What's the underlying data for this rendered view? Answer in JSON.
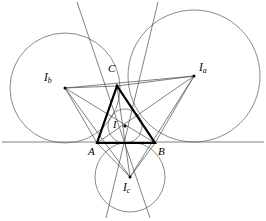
{
  "figure": {
    "domain": "diagram",
    "canvas": {
      "width": 266,
      "height": 221,
      "background": "#ffffff"
    },
    "colors": {
      "thin_line": "#4a4a4a",
      "circle_line": "#5a5a5a",
      "bold_line": "#000000",
      "point": "#000000",
      "label": "#000000"
    },
    "stroke_widths": {
      "thin": 0.7,
      "circle": 0.7,
      "bold": 2.1
    },
    "labels": {
      "A": {
        "text": "A",
        "sub": "",
        "x": 88,
        "y": 146
      },
      "B": {
        "text": "B",
        "sub": "",
        "x": 158,
        "y": 146
      },
      "C": {
        "text": "C",
        "sub": "",
        "x": 108,
        "y": 64
      },
      "Ia": {
        "text": "I",
        "sub": "a",
        "x": 198,
        "y": 63
      },
      "Ib": {
        "text": "I",
        "sub": "b",
        "x": 44,
        "y": 72
      },
      "Ic": {
        "text": "I",
        "sub": "c",
        "x": 122,
        "y": 183
      },
      "I": {
        "text": "I",
        "sub": "",
        "x": 112,
        "y": 120
      }
    },
    "points": {
      "A": {
        "x": 97,
        "y": 143,
        "dot": false
      },
      "B": {
        "x": 155,
        "y": 143,
        "dot": false
      },
      "C": {
        "x": 117,
        "y": 86,
        "dot": true
      },
      "Ia": {
        "x": 194,
        "y": 76,
        "dot": true
      },
      "Ib": {
        "x": 65,
        "y": 88,
        "dot": true
      },
      "Ic": {
        "x": 130,
        "y": 177,
        "dot": true
      },
      "I": {
        "x": 125,
        "y": 126,
        "dot": true
      }
    },
    "circles": {
      "incircle": {
        "cx": 125,
        "cy": 126,
        "r": 17,
        "name": "incircle"
      },
      "excircle_a": {
        "cx": 194,
        "cy": 76,
        "r": 66,
        "name": "excircle-opposite-A"
      },
      "excircle_b": {
        "cx": 65,
        "cy": 88,
        "r": 55,
        "name": "excircle-opposite-B"
      },
      "excircle_c": {
        "cx": 130,
        "cy": 177,
        "r": 35,
        "name": "excircle-opposite-C"
      }
    },
    "lines": {
      "baseline": {
        "x1": 2,
        "y1": 142,
        "x2": 264,
        "y2": 142,
        "name": "line-AB-extended"
      },
      "side_ac_ext": {
        "x1": 77,
        "y1": 2,
        "x2": 148,
        "y2": 216,
        "name": "line-CA-extended"
      },
      "side_bc_ext": {
        "x1": 157,
        "y1": 2,
        "x2": 108,
        "y2": 216,
        "name": "line-CB-extended"
      }
    },
    "triangle": {
      "name": "triangle-ABC",
      "vertices": [
        "A",
        "B",
        "C"
      ],
      "closed": true
    },
    "excentral_triangle": {
      "name": "triangle-IaIbIc",
      "vertices": [
        "Ia",
        "Ib",
        "Ic"
      ],
      "closed": true
    },
    "connectors": [
      {
        "from": "Ia",
        "to": "A",
        "name": "segment-Ia-A"
      },
      {
        "from": "Ia",
        "to": "B",
        "name": "segment-Ia-B"
      },
      {
        "from": "Ia",
        "to": "C",
        "name": "segment-Ia-C"
      },
      {
        "from": "Ib",
        "to": "A",
        "name": "segment-Ib-A"
      },
      {
        "from": "Ib",
        "to": "B",
        "name": "segment-Ib-B"
      },
      {
        "from": "Ib",
        "to": "C",
        "name": "segment-Ib-C"
      },
      {
        "from": "Ic",
        "to": "A",
        "name": "segment-Ic-A"
      },
      {
        "from": "Ic",
        "to": "B",
        "name": "segment-Ic-B"
      },
      {
        "from": "Ic",
        "to": "C",
        "name": "segment-Ic-C"
      }
    ]
  }
}
